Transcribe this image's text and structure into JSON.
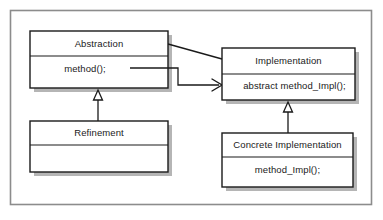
{
  "diagram": {
    "type": "uml-class-diagram",
    "frame": {
      "x": 10,
      "y": 10,
      "width": 362,
      "height": 195,
      "border_color": "#808080",
      "fill": "#ffffff"
    },
    "colors": {
      "box_fill": "#ffffff",
      "box_border": "#1a1a1a",
      "shadow": "#b3b3b3",
      "line": "#1a1a1a",
      "text": "#1a1a1a",
      "frame_border": "#8c8c8c",
      "page_background": "#ffffff"
    },
    "classes": [
      {
        "id": "abstraction",
        "name": "Abstraction",
        "members": [
          "method();"
        ],
        "x": 30,
        "y": 31,
        "width": 138,
        "height": 57,
        "header_height": 25
      },
      {
        "id": "implementation",
        "name": "Implementation",
        "members": [
          "abstract method_Impl();"
        ],
        "x": 222,
        "y": 48,
        "width": 133,
        "height": 52,
        "header_height": 26
      },
      {
        "id": "refinement",
        "name": "Refinement",
        "members": [
          ""
        ],
        "x": 30,
        "y": 121,
        "width": 138,
        "height": 51,
        "header_height": 24
      },
      {
        "id": "concrete-implementation",
        "name": "Concrete Implementation",
        "members": [
          "method_Impl();"
        ],
        "x": 222,
        "y": 133,
        "width": 131,
        "height": 54,
        "header_height": 24
      }
    ],
    "relationships": [
      {
        "id": "abstraction-to-implementation-aggregate",
        "kind": "association-line",
        "from": "abstraction",
        "to": "implementation",
        "arrowhead": "none",
        "label": ""
      },
      {
        "id": "method-calls-method-impl",
        "kind": "dependency",
        "from": "abstraction.method()",
        "to": "implementation.abstract method_Impl()",
        "arrowhead": "open-arrow",
        "label": ""
      },
      {
        "id": "refinement-generalizes-abstraction",
        "kind": "generalization",
        "from": "refinement",
        "to": "abstraction",
        "arrowhead": "hollow-triangle",
        "label": ""
      },
      {
        "id": "concrete-generalizes-implementation",
        "kind": "generalization",
        "from": "concrete-implementation",
        "to": "implementation",
        "arrowhead": "hollow-triangle",
        "label": ""
      }
    ]
  }
}
